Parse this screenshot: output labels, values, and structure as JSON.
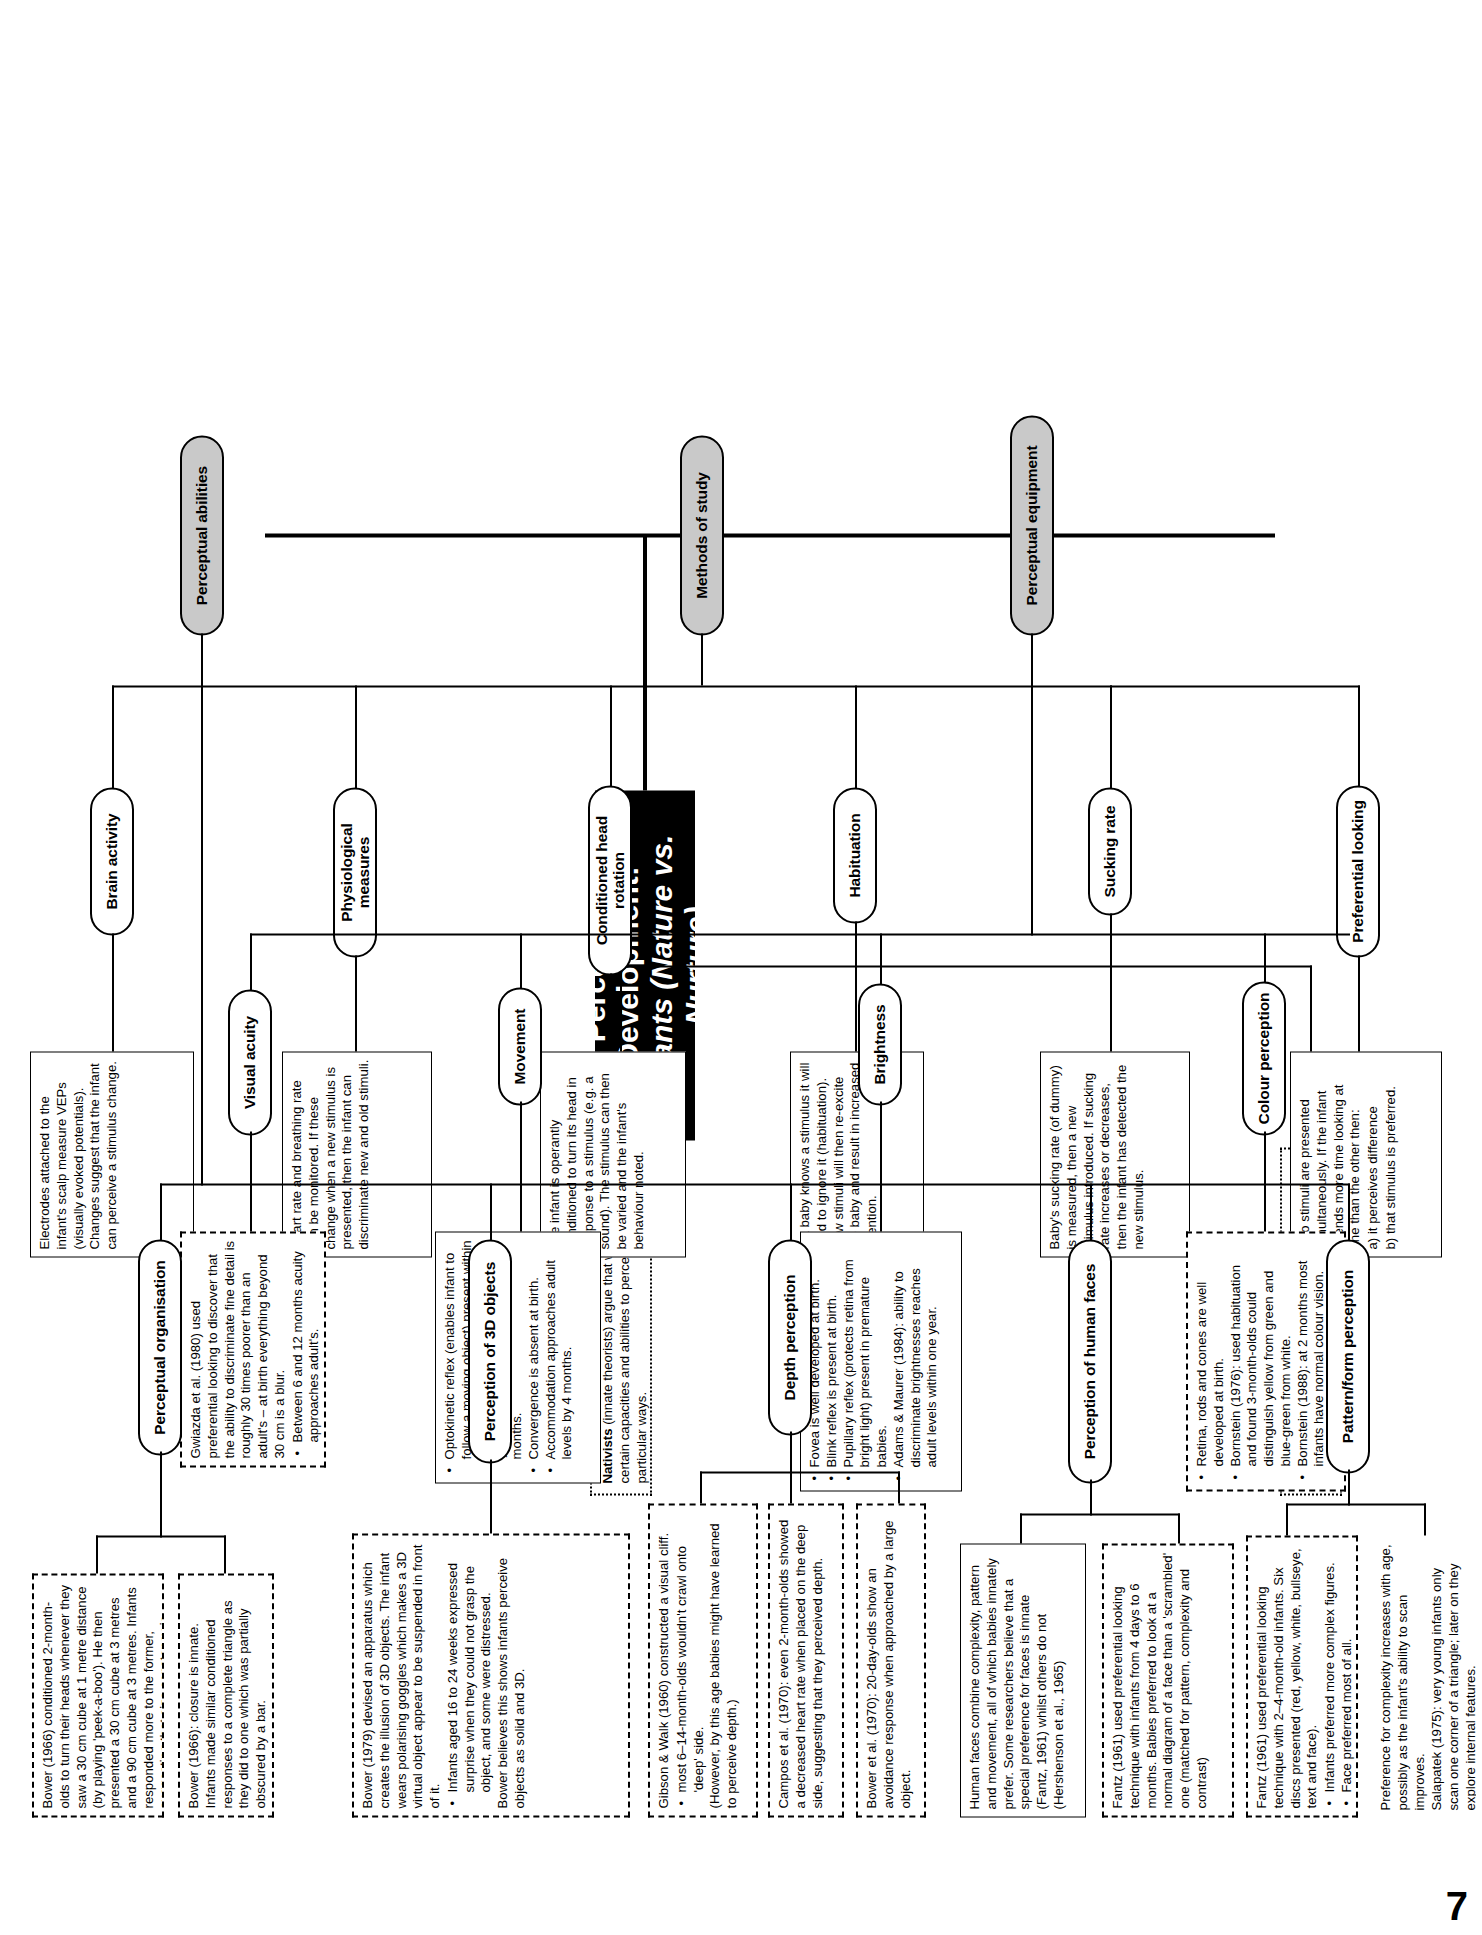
{
  "page": {
    "number": "7"
  },
  "title": {
    "line1": "Perceptual Development:",
    "line2": "Infants (Nature vs. Nurture)"
  },
  "theory_boxes": [
    {
      "name": "nativists",
      "lead": "Nativists",
      "text": " (innate theorists) argue that we are born with certain capacities and abilities to perceive the world in particular ways."
    },
    {
      "name": "empirists",
      "lead": "Empirists",
      "text": " (not empiricists) believe that our perceptual capacities and abilities develop through experience."
    }
  ],
  "branches": [
    {
      "id": "methods-of-study",
      "label": "Methods of study",
      "children": [
        {
          "id": "preferential-looking",
          "label": "Preferential looking",
          "box": {
            "style": "solid",
            "paragraphs": [
              "Two stimuli are presented simultaneously. If the infant spends more time looking at one than the other then:",
              "a) it perceives difference",
              "b) that stimulus is preferred."
            ]
          }
        },
        {
          "id": "sucking-rate",
          "label": "Sucking rate",
          "box": {
            "style": "solid",
            "paragraphs": [
              "Baby's sucking rate (of dummy) is measured, then a new stimulus introduced. If sucking rate increases or decreases, then the infant has detected the new stimulus."
            ]
          }
        },
        {
          "id": "habituation",
          "label": "Habituation",
          "box": {
            "style": "solid",
            "paragraphs": [
              "If a baby knows a stimulus it will tend to ignore it (habituation). New stimuli will then re-excite the baby and result in increased attention."
            ],
            "italic_terms": [
              "habituation"
            ]
          }
        },
        {
          "id": "conditioned-head-rotation",
          "label": "Conditioned head rotation",
          "box": {
            "style": "solid",
            "paragraphs": [
              "The infant is operantly conditioned to turn its head in response to a stimulus (e.g. a sound). The stimulus can then be varied and the infant's behaviour noted."
            ]
          }
        },
        {
          "id": "physiological-measures",
          "label": "Physiological measures",
          "box": {
            "style": "solid",
            "paragraphs": [
              "Heart rate and breathing rate can be monitored. If these change when a new stimulus is presented, then the infant can discriminate new and old stimuli."
            ],
            "italic_terms": [
              "discriminate"
            ]
          }
        },
        {
          "id": "brain-activity",
          "label": "Brain activity",
          "box": {
            "style": "solid",
            "paragraphs": [
              "Electrodes attached to the infant's scalp measure VEPs (visually evoked potentials). Changes suggest that the infant can perceive a stimulus change."
            ]
          }
        }
      ]
    },
    {
      "id": "perceptual-equipment",
      "label": "Perceptual equipment",
      "children": [
        {
          "id": "colour-perception",
          "label": "Colour perception",
          "box": {
            "style": "dashed",
            "bullets": [
              "Retina, rods and cones are well developed at birth.",
              "Bornstein (1976): used habituation and found 3-month-olds could distinguish yellow from green and blue-green from white.",
              "Bornstein (1988): at 2 months most infants have normal colour vision."
            ]
          }
        },
        {
          "id": "brightness",
          "label": "Brightness",
          "box": {
            "style": "solid",
            "bullets": [
              "Fovea is well developed at birth.",
              "Blink reflex is present at birth.",
              "Pupillary reflex (protects retina from bright light) present in premature babies.",
              "Adams & Maurer (1984): ability to discriminate brightnesses reaches adult levels within one year."
            ],
            "italic_terms": [
              "Fovea",
              "Blink reflex",
              "Pupillary reflex"
            ]
          }
        },
        {
          "id": "movement",
          "label": "Movement",
          "box": {
            "style": "solid",
            "bullets": [
              "Optokinetic reflex (enables infant to follow a moving object) present within 2 days of birth. Tracking is initially 'jerky' but improves rapidly in first 3 months.",
              "Convergence is absent at birth.",
              "Accommodation approaches adult levels by 4 months."
            ],
            "italic_terms": [
              "Optokinetic reflex",
              "Tracking",
              "Convergence",
              "Accommodation"
            ]
          }
        },
        {
          "id": "visual-acuity",
          "label": "Visual acuity",
          "box": {
            "style": "dashed",
            "paragraphs": [
              "Gwiazda et al. (1980) used preferential looking to discover that the ability to discriminate fine detail is roughly 30 times poorer than an adult's – at birth everything beyond 30 cm is a blur."
            ],
            "bullets": [
              "Between 6 and 12 months acuity approaches adult's."
            ],
            "italic_terms": [
              "et al."
            ]
          }
        }
      ]
    },
    {
      "id": "perceptual-abilities",
      "label": "Perceptual abilities",
      "children": [
        {
          "id": "pattern-form-perception",
          "label": "Pattern/form perception",
          "boxes": [
            {
              "style": "dashed",
              "paragraphs": [
                "Fantz (1961) used preferential looking technique with 2–4-month-old infants. Six discs presented (red, yellow, white, bullseye, text and face)."
              ],
              "bullets": [
                "Infants preferred more complex figures.",
                "Face preferred most of all."
              ]
            },
            {
              "style": "solid",
              "paragraphs": [
                "Preference for complexity increases with age, possibly as the infant's ability to scan improves.",
                "Salapatek (1975): very young infants only scan one corner of a triangle; later on they explore internal features."
              ]
            }
          ]
        },
        {
          "id": "perception-of-human-faces",
          "label": "Perception of human faces",
          "boxes": [
            {
              "style": "solid",
              "paragraphs": [
                "Human faces combine complexity, pattern and movement, all of which babies innately prefer. Some researchers believe that a special preference for faces is innate (Fantz, 1961) whilst others do not (Hershenson et al., 1965)"
              ],
              "italic_terms": [
                "et al."
              ]
            },
            {
              "style": "dashed",
              "paragraphs": [
                "Fantz (1961) used preferential looking technique with infants from 4 days to 6 months. Babies preferred to look at a normal diagram of a face than a 'scrambled' one (matched for pattern, complexity and contrast)"
              ]
            }
          ]
        },
        {
          "id": "depth-perception",
          "label": "Depth perception",
          "boxes": [
            {
              "style": "dashed",
              "paragraphs": [
                "Gibson & Walk (1960) constructed a visual cliff."
              ],
              "bullets": [
                "most 6–14-month-olds wouldn't crawl onto 'deep' side."
              ],
              "after": "(However, by this age babies might have learned to perceive depth.)",
              "italic_terms": [
                "visual cliff"
              ]
            },
            {
              "style": "dashed",
              "paragraphs": [
                "Campos et al. (1970): even 2-month-olds showed a decreased heart rate when placed on the deep side, suggesting that they perceived depth."
              ],
              "italic_terms": [
                "et al."
              ]
            },
            {
              "style": "dashed",
              "paragraphs": [
                "Bower et al. (1970): 20-day-olds show an avoidance response when approached by a large object."
              ],
              "italic_terms": [
                "et al.",
                "avoidance response"
              ]
            }
          ]
        },
        {
          "id": "perception-of-3d-objects",
          "label": "Perception of 3D objects",
          "boxes": [
            {
              "style": "dashed",
              "paragraphs": [
                "Bower (1979) devised an apparatus which creates the illusion of 3D objects. The infant wears polarising goggles which makes a 3D virtual object appear to be suspended in front of it."
              ],
              "bullets": [
                "Infants aged 16 to 24 weeks expressed surprise when they could not grasp the object, and some were distressed."
              ],
              "after": "Bower believes this shows infants perceive objects as solid and 3D."
            }
          ]
        },
        {
          "id": "perceptual-organisation",
          "label": "Perceptual organisation",
          "boxes": [
            {
              "style": "dashed",
              "paragraphs": [
                "Bower (1966) conditioned 2-month-olds to turn their heads whenever they saw a 30 cm cube at 1 metre distance (by playing 'peek-a-boo'). He then presented a 30 cm cube at 3 metres and a 90 cm cube at 3 metres. Infants responded more to the former, suggesting that size constancy is innate."
              ],
              "italic_terms": [
                "size constancy is innate"
              ]
            },
            {
              "style": "dashed",
              "paragraphs": [
                "Bower (1966): closure is innate. Infants made similar conditioned responses to a complete triangle as they did to one which was partially obscured by a bar."
              ],
              "italic_terms": [
                "closure is innate"
              ]
            }
          ]
        }
      ]
    }
  ]
}
